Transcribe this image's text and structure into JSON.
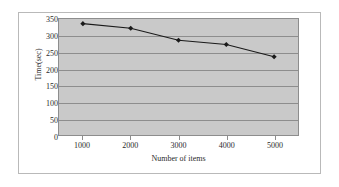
{
  "chart_data": {
    "type": "line",
    "title": "",
    "subtitle": "",
    "xlabel": "Number of items",
    "ylabel": "Time(sec)",
    "categories": [
      "1000",
      "2000",
      "3000",
      "4000",
      "5000"
    ],
    "x": [
      1000,
      2000,
      3000,
      4000,
      5000
    ],
    "values": [
      336,
      322,
      286,
      273,
      236
    ],
    "series": [
      {
        "name": "Time",
        "values": [
          336,
          322,
          286,
          273,
          236
        ]
      }
    ],
    "ylim": [
      0,
      350
    ],
    "yticks": [
      0,
      50,
      100,
      150,
      200,
      250,
      300,
      350
    ],
    "ytick_labels": [
      "0",
      "50",
      "100",
      "150",
      "200",
      "250",
      "300",
      "350"
    ],
    "xtick_labels": [
      "1000",
      "2000",
      "3000",
      "4000",
      "5000"
    ],
    "grid": "horizontal",
    "legend": "none",
    "plot_background": "#c9c9c9",
    "line_color": "#1a1a1a",
    "marker_color": "#1a1a1a",
    "marker": "diamond",
    "gridline_color": "#8d8d8d",
    "frame_border_color": "#b9b9b9",
    "page_background": "#ffffff",
    "text_color": "#2b2b2b"
  }
}
